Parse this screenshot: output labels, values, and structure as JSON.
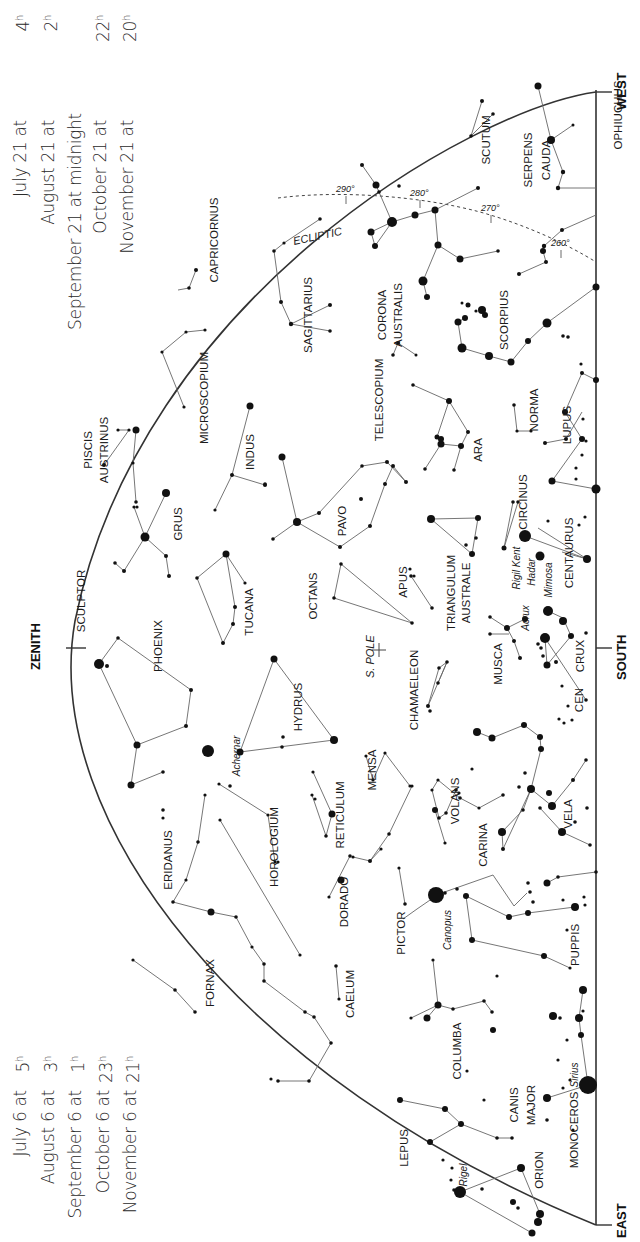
{
  "colors": {
    "ink": "#111111",
    "line": "#555555",
    "background": "#ffffff",
    "text_light": "#2a2a2a"
  },
  "times_top": {
    "rows": [
      {
        "date": "July 21 at",
        "hour": "4",
        "sup": "h"
      },
      {
        "date": "August 21 at",
        "hour": "2",
        "sup": "h"
      },
      {
        "date": "September 21 at midnight",
        "hour": "",
        "sup": ""
      },
      {
        "date": "October 21 at",
        "hour": "22",
        "sup": "h"
      },
      {
        "date": "November 21 at",
        "hour": "20",
        "sup": "h"
      }
    ]
  },
  "times_bottom": {
    "rows": [
      {
        "date": "July 6 at",
        "hour": "5",
        "sup": "h"
      },
      {
        "date": "August 6 at",
        "hour": "3",
        "sup": "h"
      },
      {
        "date": "September 6 at",
        "hour": "1",
        "sup": "h"
      },
      {
        "date": "October 6 at",
        "hour": "23",
        "sup": "h"
      },
      {
        "date": "November 6 at",
        "hour": "21",
        "sup": "h"
      }
    ]
  },
  "directions": {
    "zenith": "ZENITH",
    "south": "SOUTH",
    "east": "EAST",
    "west": "WEST",
    "pole": "S. POLE"
  },
  "ecliptic": {
    "label": "ECLIPTIC",
    "marks": [
      {
        "label": "290°",
        "x": 346,
        "y": 196
      },
      {
        "label": "280°",
        "x": 420,
        "y": 200
      },
      {
        "label": "270°",
        "x": 491,
        "y": 215
      },
      {
        "label": "260°",
        "x": 561,
        "y": 250
      }
    ]
  },
  "constellations": [
    {
      "name": "OPHIUCHUS",
      "x": 622,
      "y": 115
    },
    {
      "name": "SERPENS",
      "x": 532,
      "y": 160
    },
    {
      "name": "CAUDA",
      "x": 550,
      "y": 160
    },
    {
      "name": "SCUTUM",
      "x": 490,
      "y": 140
    },
    {
      "name": "SAGITTARIUS",
      "x": 312,
      "y": 315
    },
    {
      "name": "CORONA",
      "x": 386,
      "y": 315
    },
    {
      "name": "AUSTRALIS",
      "x": 402,
      "y": 315
    },
    {
      "name": "SCORPIUS",
      "x": 508,
      "y": 320
    },
    {
      "name": "CAPRICORNUS",
      "x": 218,
      "y": 240
    },
    {
      "name": "MICROSCOPIUM",
      "x": 208,
      "y": 398
    },
    {
      "name": "TELESCOPIUM",
      "x": 383,
      "y": 400
    },
    {
      "name": "NORMA",
      "x": 538,
      "y": 410
    },
    {
      "name": "LUPUS",
      "x": 571,
      "y": 425
    },
    {
      "name": "ARA",
      "x": 482,
      "y": 450
    },
    {
      "name": "PISCIS",
      "x": 92,
      "y": 450
    },
    {
      "name": "AUSTRINUS",
      "x": 108,
      "y": 450
    },
    {
      "name": "INDUS",
      "x": 254,
      "y": 452
    },
    {
      "name": "CIRCINUS",
      "x": 527,
      "y": 502
    },
    {
      "name": "GRUS",
      "x": 182,
      "y": 524
    },
    {
      "name": "PAVO",
      "x": 346,
      "y": 521
    },
    {
      "name": "CENTAURUS",
      "x": 573,
      "y": 553
    },
    {
      "name": "SCULPTOR",
      "x": 85,
      "y": 601
    },
    {
      "name": "TUCANA",
      "x": 253,
      "y": 612
    },
    {
      "name": "OCTANS",
      "x": 317,
      "y": 596
    },
    {
      "name": "APUS",
      "x": 407,
      "y": 582
    },
    {
      "name": "TRIANGULUM",
      "x": 455,
      "y": 593
    },
    {
      "name": "AUSTRALE",
      "x": 470,
      "y": 593
    },
    {
      "name": "CRUX",
      "x": 584,
      "y": 656
    },
    {
      "name": "PHOENIX",
      "x": 162,
      "y": 646
    },
    {
      "name": "MUSCA",
      "x": 502,
      "y": 664
    },
    {
      "name": "CHAMAELEON",
      "x": 418,
      "y": 690
    },
    {
      "name": "HYDRUS",
      "x": 302,
      "y": 707
    },
    {
      "name": "CEN",
      "x": 583,
      "y": 700
    },
    {
      "name": "MENSA",
      "x": 376,
      "y": 770
    },
    {
      "name": "VOLANS",
      "x": 459,
      "y": 801
    },
    {
      "name": "VELA",
      "x": 572,
      "y": 814
    },
    {
      "name": "RETICULUM",
      "x": 344,
      "y": 815
    },
    {
      "name": "HOROLOGIUM",
      "x": 278,
      "y": 847
    },
    {
      "name": "ERIDANUS",
      "x": 172,
      "y": 860
    },
    {
      "name": "CARINA",
      "x": 487,
      "y": 845
    },
    {
      "name": "DORADO",
      "x": 348,
      "y": 902
    },
    {
      "name": "PICTOR",
      "x": 405,
      "y": 933
    },
    {
      "name": "PUPPIS",
      "x": 579,
      "y": 945
    },
    {
      "name": "FORNAX",
      "x": 214,
      "y": 983
    },
    {
      "name": "CAELUM",
      "x": 354,
      "y": 994
    },
    {
      "name": "COLUMBA",
      "x": 461,
      "y": 1051
    },
    {
      "name": "CANIS",
      "x": 518,
      "y": 1105
    },
    {
      "name": "MAJOR",
      "x": 535,
      "y": 1105
    },
    {
      "name": "LEPUS",
      "x": 408,
      "y": 1148
    },
    {
      "name": "MONOCEROS",
      "x": 578,
      "y": 1130
    },
    {
      "name": "ORION",
      "x": 543,
      "y": 1170
    }
  ],
  "named_stars": [
    {
      "name": "Rigil Kent",
      "x": 520,
      "y": 568
    },
    {
      "name": "Hadar",
      "x": 535,
      "y": 572
    },
    {
      "name": "Mimosa",
      "x": 552,
      "y": 580
    },
    {
      "name": "Acrux",
      "x": 529,
      "y": 618
    },
    {
      "name": "Achernar",
      "x": 240,
      "y": 756
    },
    {
      "name": "Canopus",
      "x": 451,
      "y": 930
    },
    {
      "name": "Sirius",
      "x": 578,
      "y": 1075
    },
    {
      "name": "Rigel",
      "x": 467,
      "y": 1175
    }
  ]
}
